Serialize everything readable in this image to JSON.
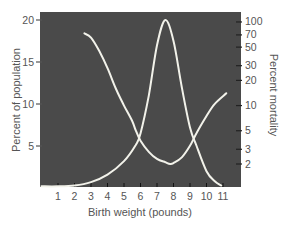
{
  "chart_data": {
    "type": "line",
    "title": "",
    "xlabel": "Birth weight (pounds)",
    "ylabel": "Percent of population",
    "ylabel_right": "Percent mortality",
    "x_ticks": [
      1,
      2,
      3,
      4,
      5,
      6,
      7,
      8,
      9,
      10,
      11
    ],
    "xlim": [
      0,
      12
    ],
    "y_ticks_left": [
      5,
      10,
      15,
      20
    ],
    "ylim_left": [
      0,
      21
    ],
    "y_ticks_right": [
      2,
      3,
      5,
      10,
      20,
      30,
      50,
      70,
      100
    ],
    "y_right_scale": "log",
    "grid": false,
    "legend": null,
    "colors": {
      "plot_background": "#4a4a4a",
      "curve": "#f2f2ea",
      "axis_text": "#555555"
    },
    "series": [
      {
        "name": "Percent of population",
        "axis": "left",
        "x": [
          0,
          1,
          2,
          3,
          4,
          5,
          5.7,
          6,
          6.5,
          7,
          7.5,
          8,
          8.5,
          9,
          9.4,
          10,
          10.5,
          10.9
        ],
        "values": [
          0.2,
          0.2,
          0.3,
          0.7,
          1.6,
          3.2,
          5.1,
          6.5,
          11,
          17,
          20,
          17.5,
          12,
          7.2,
          5,
          2,
          0.8,
          0.3
        ]
      },
      {
        "name": "Percent mortality",
        "axis": "right",
        "x": [
          2.6,
          3,
          3.5,
          4,
          4.5,
          5,
          5.5,
          5.7,
          6,
          6.5,
          7,
          7.5,
          7.8,
          8,
          8.5,
          9,
          9.4,
          10,
          10.5,
          11.2
        ],
        "values": [
          73,
          65,
          45,
          28,
          16,
          10,
          6.5,
          5.1,
          3.8,
          2.8,
          2.3,
          2.1,
          2.0,
          2.05,
          2.4,
          3.3,
          4.7,
          7.5,
          10.5,
          14
        ]
      }
    ]
  }
}
